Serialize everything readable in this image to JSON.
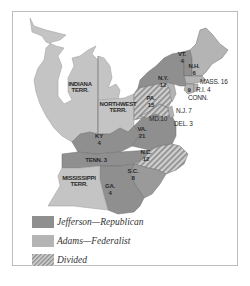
{
  "map": {
    "territories": [
      {
        "name": "INDIANA",
        "suffix": "TERR."
      },
      {
        "name": "NORTHWEST",
        "suffix": "TERR."
      },
      {
        "name": "MISSISSIPPI",
        "suffix": "TERR."
      }
    ],
    "states": [
      {
        "abbr": "VT.",
        "votes": "4",
        "party": "Jefferson-Republican"
      },
      {
        "abbr": "N.H.",
        "votes": "6",
        "party": "Adams-Federalist"
      },
      {
        "abbr": "N.Y.",
        "votes": "12",
        "party": "Jefferson-Republican"
      },
      {
        "abbr": "MASS.",
        "votes": "16",
        "party": "Adams-Federalist",
        "label": "MASS. 16"
      },
      {
        "abbr": "R.I.",
        "votes": "4",
        "party": "Adams-Federalist",
        "label": "R.I. 4"
      },
      {
        "abbr": "CONN.",
        "votes": "9",
        "party": "Adams-Federalist"
      },
      {
        "abbr": "PA.",
        "votes": "15",
        "party": "Divided"
      },
      {
        "abbr": "N.J.",
        "votes": "7",
        "party": "Adams-Federalist",
        "label": "N.J. 7"
      },
      {
        "abbr": "MD.",
        "votes": "10",
        "party": "Divided",
        "label": "MD.10"
      },
      {
        "abbr": "DEL.",
        "votes": "3",
        "party": "Adams-Federalist",
        "label": "DEL. 3"
      },
      {
        "abbr": "VA.",
        "votes": "21",
        "party": "Jefferson-Republican"
      },
      {
        "abbr": "KY",
        "votes": "4",
        "party": "Jefferson-Republican"
      },
      {
        "abbr": "TENN.",
        "votes": "3",
        "party": "Jefferson-Republican",
        "label": "TENN. 3"
      },
      {
        "abbr": "N.C.",
        "votes": "12",
        "party": "Divided"
      },
      {
        "abbr": "S.C.",
        "votes": "8",
        "party": "Jefferson-Republican"
      },
      {
        "abbr": "GA.",
        "votes": "4",
        "party": "Jefferson-Republican"
      }
    ],
    "colors": {
      "jefferson": "#8f8f8f",
      "adams": "#b4b4b4",
      "territory": "#c8c8c8",
      "divided_stripe_a": "#d0d0d0",
      "divided_stripe_b": "#8a8a8a",
      "border": "#777777"
    }
  },
  "legend": {
    "items": [
      {
        "label": "Jefferson—Republican",
        "key": "jefferson"
      },
      {
        "label": "Adams—Federalist",
        "key": "adams"
      },
      {
        "label": "Divided",
        "key": "divided"
      }
    ]
  }
}
